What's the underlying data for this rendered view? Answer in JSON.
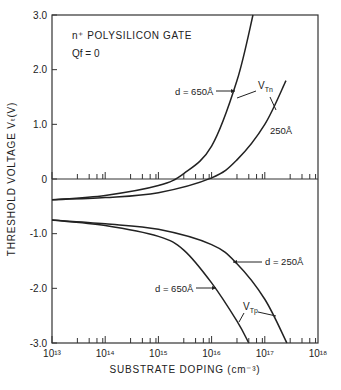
{
  "chart_data": {
    "type": "line",
    "title": "",
    "annotations": {
      "gate": "n⁺ POLYSILICON GATE",
      "charge": "Qf = 0",
      "vtn_label": "V",
      "vtn_sub": "Tn",
      "vtp_label": "V",
      "vtp_sub": "Tp",
      "n_d650": "d = 650Å",
      "n_d250": "250Å",
      "p_d250": "d = 250Å",
      "p_d650": "d = 650Å"
    },
    "xlabel": "SUBSTRATE DOPING (cm⁻³)",
    "ylabel": "THRESHOLD VOLTAGE  Vₜ(V)",
    "xscale": "log",
    "xlim": [
      10000000000000.0,
      1e+18
    ],
    "ylim": [
      -3.0,
      3.0
    ],
    "x_ticks": [
      "10¹³",
      "10¹⁴",
      "10¹⁵",
      "10¹⁶",
      "10¹⁷",
      "10¹⁸"
    ],
    "y_ticks": [
      "3.0",
      "2.0",
      "1.0",
      "0",
      "-1.0",
      "-2.0",
      "-3.0"
    ],
    "grid": false,
    "series": [
      {
        "name": "VTn d=650Å",
        "x": [
          10000000000000.0,
          100000000000000.0,
          1000000000000000.0,
          3000000000000000.0,
          1e+16,
          3e+16,
          6e+16
        ],
        "y": [
          -0.38,
          -0.3,
          -0.12,
          0.1,
          0.6,
          1.8,
          3.0
        ]
      },
      {
        "name": "VTn d=250Å",
        "x": [
          10000000000000.0,
          100000000000000.0,
          1000000000000000.0,
          1e+16,
          3e+16,
          1e+17,
          2.5e+17
        ],
        "y": [
          -0.38,
          -0.34,
          -0.25,
          0.02,
          0.35,
          1.0,
          1.8
        ]
      },
      {
        "name": "VTp d=650Å",
        "x": [
          10000000000000.0,
          100000000000000.0,
          1000000000000000.0,
          3000000000000000.0,
          1e+16,
          3e+16,
          5e+16
        ],
        "y": [
          -0.75,
          -0.85,
          -1.05,
          -1.3,
          -1.9,
          -2.6,
          -3.0
        ]
      },
      {
        "name": "VTp d=250Å",
        "x": [
          10000000000000.0,
          100000000000000.0,
          1000000000000000.0,
          1e+16,
          3e+16,
          1e+17,
          2.6e+17
        ],
        "y": [
          -0.75,
          -0.82,
          -0.92,
          -1.2,
          -1.55,
          -2.2,
          -3.0
        ]
      }
    ]
  }
}
